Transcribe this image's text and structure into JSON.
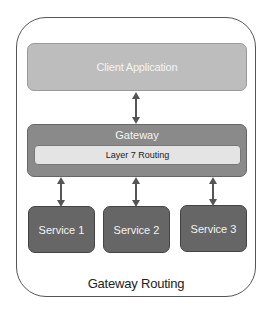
{
  "diagram": {
    "title": "Gateway Routing",
    "client": {
      "label": "Client Application"
    },
    "gateway": {
      "label": "Gateway",
      "layer_label": "Layer 7 Routing"
    },
    "services": [
      {
        "label": "Service 1"
      },
      {
        "label": "Service 2"
      },
      {
        "label": "Service 3"
      }
    ],
    "connections": [
      {
        "from": "Client Application",
        "to": "Gateway",
        "type": "bidirectional"
      },
      {
        "from": "Gateway",
        "to": "Service 1",
        "type": "bidirectional"
      },
      {
        "from": "Gateway",
        "to": "Service 2",
        "type": "bidirectional"
      },
      {
        "from": "Gateway",
        "to": "Service 3",
        "type": "bidirectional"
      }
    ],
    "colors": {
      "client": "#bdbdbd",
      "gateway": "#8a8a8a",
      "layer": "#e4e4e4",
      "service": "#666666",
      "arrow": "#555555"
    }
  }
}
